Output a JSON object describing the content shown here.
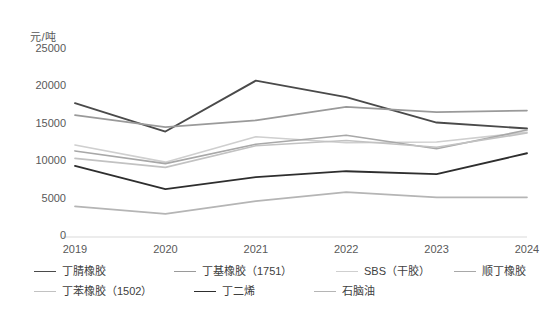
{
  "chart_data": {
    "type": "line",
    "title": "",
    "subtitle": "",
    "unit_label": "元/吨",
    "xlabel": "",
    "ylabel": "",
    "categories": [
      "2019",
      "2020",
      "2021",
      "2022",
      "2023",
      "2024"
    ],
    "x": [
      "2019",
      "2020",
      "2021",
      "2022",
      "2023",
      "2024"
    ],
    "ylim": [
      0,
      25000
    ],
    "ytick_values": [
      0,
      5000,
      10000,
      15000,
      20000,
      25000
    ],
    "ytick_labels": [
      "0",
      "5000",
      "10000",
      "15000",
      "20000",
      "25000"
    ],
    "grid": false,
    "legend_position": "bottom",
    "series": [
      {
        "name": "丁腈橡胶",
        "color": "#4a4a4a",
        "width": 1.9,
        "values": [
          17900,
          14100,
          20900,
          18700,
          15300,
          14500
        ]
      },
      {
        "name": "丁基橡胶（1751）",
        "color": "#9a9a9a",
        "width": 1.7,
        "values": [
          16300,
          14700,
          15600,
          17400,
          16700,
          16900
        ]
      },
      {
        "name": "SBS（干胶）",
        "color": "#cfcfcf",
        "width": 1.7,
        "values": [
          12300,
          10000,
          13400,
          12600,
          12700,
          14000
        ]
      },
      {
        "name": "顺丁橡胶",
        "color": "#a8a8a8",
        "width": 1.7,
        "values": [
          11500,
          9800,
          12400,
          13600,
          11800,
          14300
        ]
      },
      {
        "name": "丁苯橡胶（1502）",
        "color": "#c2c2c2",
        "width": 1.7,
        "values": [
          10500,
          9300,
          12200,
          12900,
          12000,
          13900
        ]
      },
      {
        "name": "丁二烯",
        "color": "#2e2e2e",
        "width": 1.9,
        "values": [
          9500,
          6400,
          8000,
          8800,
          8400,
          11200
        ]
      },
      {
        "name": "石脑油",
        "color": "#b5b5b5",
        "width": 1.7,
        "values": [
          4100,
          3100,
          4800,
          6000,
          5300,
          5300
        ]
      }
    ]
  },
  "axis": {
    "unit_label": "元/吨"
  },
  "legend": {
    "items": [
      {
        "label": "丁腈橡胶"
      },
      {
        "label": "丁基橡胶（1751）"
      },
      {
        "label": "SBS（干胶）"
      },
      {
        "label": "顺丁橡胶"
      },
      {
        "label": "丁苯橡胶（1502）"
      },
      {
        "label": "丁二烯"
      },
      {
        "label": "石脑油"
      }
    ]
  }
}
